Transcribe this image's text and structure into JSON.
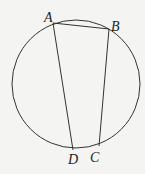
{
  "diagram": {
    "type": "inscribed-quadrilateral",
    "circle": {
      "cx": 76,
      "cy": 84,
      "r": 64
    },
    "points": [
      {
        "id": "A",
        "label": "A",
        "x": 53,
        "y": 23,
        "lx": 44,
        "ly": 22
      },
      {
        "id": "B",
        "label": "B",
        "x": 109,
        "y": 29,
        "lx": 111,
        "ly": 31
      },
      {
        "id": "C",
        "label": "C",
        "x": 99,
        "y": 146,
        "lx": 90,
        "ly": 162
      },
      {
        "id": "D",
        "label": "D",
        "x": 73,
        "y": 150,
        "lx": 68,
        "ly": 164
      }
    ],
    "segments": [
      [
        "A",
        "B"
      ],
      [
        "B",
        "C"
      ],
      [
        "A",
        "D"
      ]
    ],
    "stroke_color": "#333333"
  }
}
